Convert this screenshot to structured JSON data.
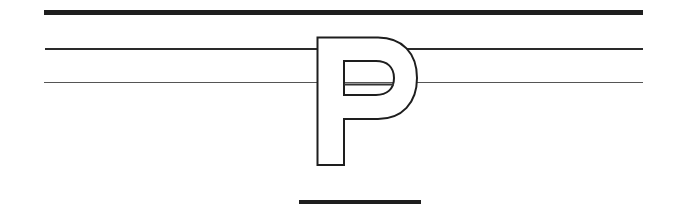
{
  "figure": {
    "letter": "P",
    "lines": [
      {
        "name": "top-thick-line",
        "weight": "thick"
      },
      {
        "name": "middle-line",
        "weight": "medium"
      },
      {
        "name": "bottom-guide-line",
        "weight": "thin"
      }
    ],
    "underline": "short thick bar"
  }
}
